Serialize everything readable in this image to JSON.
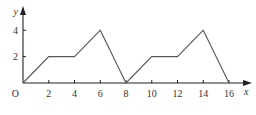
{
  "chart_data": {
    "type": "line",
    "title": "",
    "xlabel": "x",
    "ylabel": "y",
    "origin_label": "O",
    "x": [
      0,
      2,
      4,
      6,
      8,
      10,
      12,
      14,
      16
    ],
    "series": [
      {
        "name": "y",
        "values": [
          0,
          2,
          2,
          4,
          0,
          2,
          2,
          4,
          0
        ]
      }
    ],
    "x_ticks": [
      2,
      4,
      6,
      8,
      10,
      12,
      14,
      16
    ],
    "x_tick_labels": [
      "2",
      "4",
      "6",
      "8",
      "10",
      "12",
      "14",
      "16"
    ],
    "y_ticks": [
      2,
      4
    ],
    "y_tick_labels": [
      "2",
      "4"
    ],
    "xlim": [
      0,
      17
    ],
    "ylim": [
      0,
      5.5
    ],
    "grid": false,
    "legend": "none",
    "colors": {
      "line": "#555555",
      "axis": "#222222",
      "text": "#333333"
    }
  }
}
